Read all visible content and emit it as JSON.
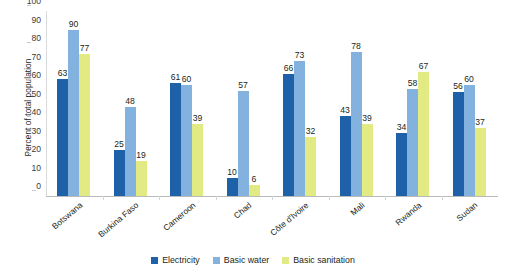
{
  "chart_data": {
    "type": "bar",
    "title": "",
    "subtitle": "",
    "xlabel": "",
    "ylabel": "Percent of total population",
    "ylim": [
      0,
      100
    ],
    "yticks": [
      0,
      10,
      20,
      30,
      40,
      50,
      60,
      70,
      80,
      90,
      100
    ],
    "grid": false,
    "legend_position": "bottom",
    "categories": [
      "Botswana",
      "Burkina Faso",
      "Cameroon",
      "Chad",
      "Côte d'Ivoire",
      "Mali",
      "Rwanda",
      "Sudan"
    ],
    "series": [
      {
        "name": "Electricity",
        "color": "#1f61a8",
        "values": [
          63,
          25,
          61,
          10,
          66,
          43,
          34,
          56
        ]
      },
      {
        "name": "Basic water",
        "color": "#83b2de",
        "values": [
          90,
          48,
          60,
          57,
          73,
          78,
          58,
          60
        ]
      },
      {
        "name": "Basic sanitation",
        "color": "#e2ea84",
        "values": [
          77,
          19,
          39,
          6,
          32,
          39,
          67,
          37
        ]
      }
    ]
  }
}
